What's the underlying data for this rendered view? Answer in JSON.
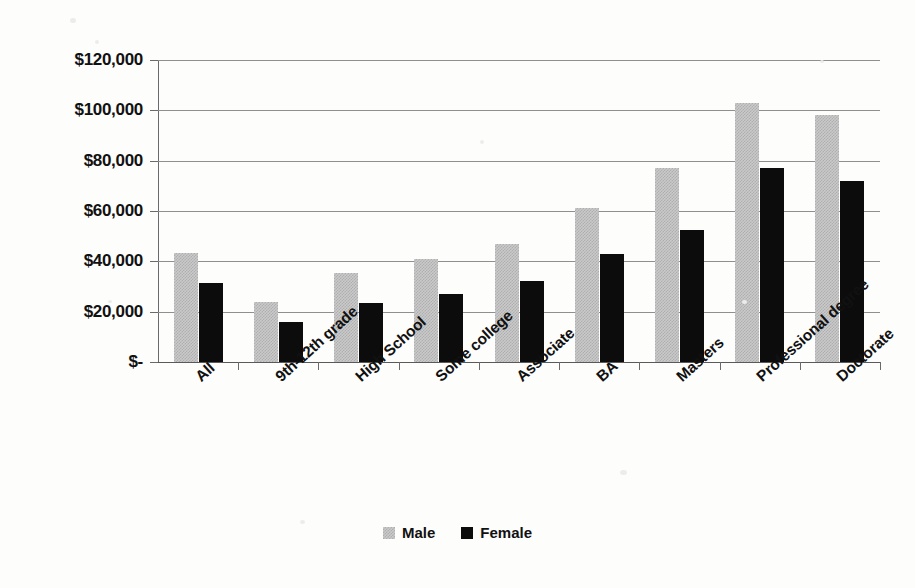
{
  "chart_data": {
    "type": "bar",
    "title": "",
    "subtitle": "",
    "xlabel": "",
    "ylabel": "",
    "grid": true,
    "legend_position": "bottom",
    "ylim": [
      0,
      120000
    ],
    "ytick_values": [
      120000,
      100000,
      80000,
      60000,
      40000,
      20000,
      0
    ],
    "ytick_labels": [
      "$120,000",
      "$100,000",
      "$80,000",
      "$60,000",
      "$40,000",
      "$20,000",
      "$-"
    ],
    "categories": [
      "All",
      "9th-12th grade",
      "High School",
      "Some college",
      "Associate",
      "BA",
      "Masters",
      "Professional degree",
      "Doctorate"
    ],
    "series": [
      {
        "name": "Male",
        "color": "#cacaca",
        "values": [
          43300,
          23800,
          35400,
          41000,
          47000,
          61000,
          77000,
          103000,
          98000
        ]
      },
      {
        "name": "Female",
        "color": "#0c0c0c",
        "values": [
          31400,
          15900,
          23400,
          27000,
          32000,
          43000,
          52500,
          77000,
          72000
        ]
      }
    ]
  },
  "legend": {
    "items": [
      {
        "label": "Male",
        "swatch": "male-swatch"
      },
      {
        "label": "Female",
        "swatch": "female-swatch"
      }
    ]
  }
}
